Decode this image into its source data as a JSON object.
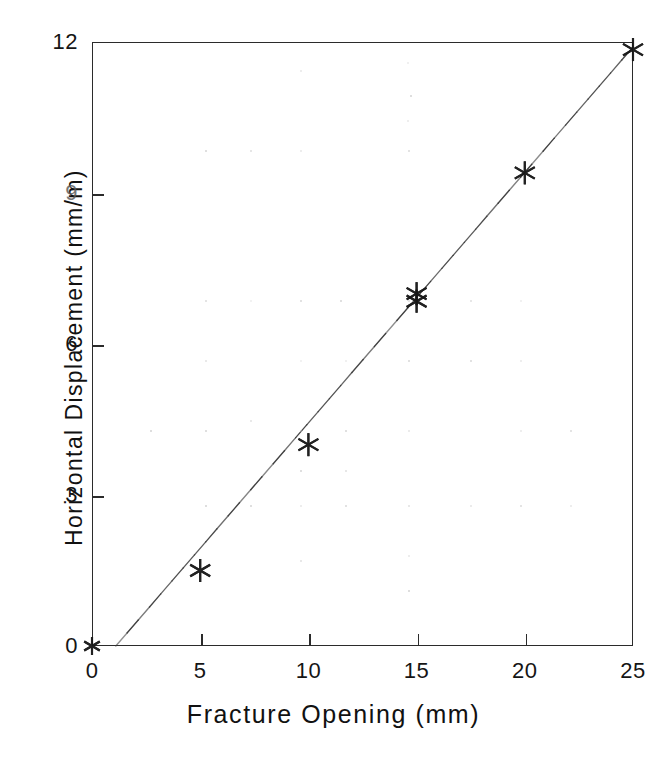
{
  "chart_data": {
    "type": "scatter",
    "title": "",
    "xlabel": "Fracture Opening (mm)",
    "ylabel": "Horizontal Displacement (mm/m)",
    "xlim": [
      0,
      25
    ],
    "ylim": [
      0,
      12
    ],
    "grid": false,
    "legend": null,
    "xticks": [
      0,
      5,
      10,
      15,
      20,
      25
    ],
    "xtick_labels": [
      "0",
      "5",
      "10",
      "15",
      "20",
      "25"
    ],
    "yticks": [
      0,
      3,
      6,
      9,
      12
    ],
    "ytick_labels": [
      "0",
      "3",
      "6",
      "9",
      "12"
    ],
    "marker": "asterisk",
    "series": [
      {
        "name": "Measured data",
        "marker": "asterisk",
        "points": [
          {
            "x": 0,
            "y": 0
          },
          {
            "x": 5,
            "y": 1.5
          },
          {
            "x": 10,
            "y": 4.0
          },
          {
            "x": 15,
            "y": 7.0
          },
          {
            "x": 15,
            "y": 6.85
          },
          {
            "x": 20,
            "y": 9.4
          },
          {
            "x": 25,
            "y": 11.85
          }
        ]
      },
      {
        "name": "Fitted trend line",
        "type": "line",
        "points": [
          {
            "x": 1.1,
            "y": 0
          },
          {
            "x": 25,
            "y": 11.9
          }
        ]
      }
    ]
  },
  "axes": {
    "x_title": "Fracture Opening (mm)",
    "y_title": "Horizontal Displacement (mm/m)"
  }
}
